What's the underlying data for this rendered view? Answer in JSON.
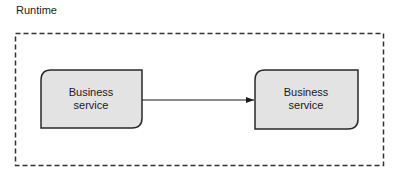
{
  "diagram": {
    "title": "Runtime",
    "container": {
      "style": "dashed",
      "stroke": "#333333"
    },
    "nodes": [
      {
        "id": "left",
        "label_line1": "Business",
        "label_line2": "service",
        "fill": "#e3e3e3"
      },
      {
        "id": "right",
        "label_line1": "Business",
        "label_line2": "service",
        "fill": "#e3e3e3"
      }
    ],
    "edges": [
      {
        "from": "left",
        "to": "right",
        "arrow": "filled"
      }
    ]
  }
}
